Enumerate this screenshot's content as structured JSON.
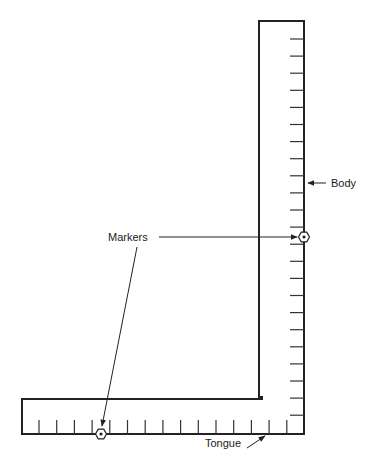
{
  "diagram": {
    "labels": {
      "body": "Body",
      "markers": "Markers",
      "tongue": "Tongue"
    },
    "parts": [
      {
        "id": "body",
        "label": "Body",
        "description": "Long vertical arm of the square"
      },
      {
        "id": "tongue",
        "label": "Tongue",
        "description": "Short horizontal arm of the square"
      },
      {
        "id": "markers",
        "label": "Markers",
        "description": "Two hexagonal marker points, one on the body edge and one on the tongue edge"
      }
    ],
    "body_tick_count": 23,
    "tongue_tick_count": 15,
    "icons": {
      "marker": "hexagon-marker-icon",
      "arrow": "arrow-icon"
    },
    "colors": {
      "line": "#222222",
      "background": "#ffffff"
    }
  }
}
